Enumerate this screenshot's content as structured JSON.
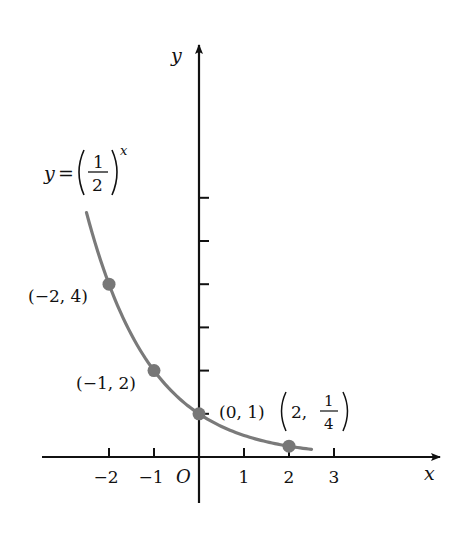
{
  "chart_data": {
    "type": "line",
    "title": "",
    "function_label": {
      "lhs": "y",
      "eq": "=",
      "base_num": "1",
      "base_den": "2",
      "exponent": "x"
    },
    "xlabel": "x",
    "ylabel": "y",
    "origin_label": "O",
    "x_ticks": [
      -2,
      -1,
      1,
      2,
      3
    ],
    "x_tick_labels": [
      "−2",
      "−1",
      "1",
      "2",
      "3"
    ],
    "y_ticks": [
      1,
      2,
      3,
      4,
      5,
      6
    ],
    "y_tick_labels": [],
    "xlim": [
      -3.5,
      5.4
    ],
    "ylim": [
      -1,
      9.5
    ],
    "grid": false,
    "curve": {
      "x_start": -2.5,
      "x_end": 2.5,
      "color": "#7a7a7a"
    },
    "points": [
      {
        "x": -2,
        "y": 4,
        "label": "(−2, 4)"
      },
      {
        "x": -1,
        "y": 2,
        "label": "(−1, 2)"
      },
      {
        "x": 0,
        "y": 1,
        "label": "(0, 1)"
      },
      {
        "x": 2,
        "y": 0.25,
        "label_prefix": "2,",
        "label_num": "1",
        "label_den": "4"
      }
    ],
    "colors": {
      "axis": "#111111",
      "curve": "#7a7a7a",
      "point": "#777777"
    }
  }
}
